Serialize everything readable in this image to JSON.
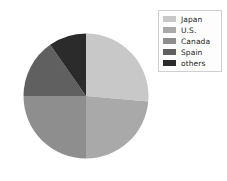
{
  "chart_data": {
    "type": "pie",
    "title": "",
    "categories": [
      "Japan",
      "U.S.",
      "Canada",
      "Spain",
      "others"
    ],
    "values": [
      26,
      24,
      25,
      15,
      10
    ],
    "units": "percent",
    "start_angle_deg": 90,
    "direction": "clockwise",
    "slice_boundaries_deg_clockwise_from_top": [
      0,
      95,
      180,
      270,
      325,
      360
    ],
    "colors": [
      "#c8c8c8",
      "#a9a9a9",
      "#8e8e8e",
      "#606060",
      "#2b2b2b"
    ],
    "legend": {
      "position": "upper right",
      "border_color": "#cfcfcf",
      "background": "#fdfdfd",
      "entries": [
        {
          "label": "Japan",
          "color": "#c8c8c8"
        },
        {
          "label": "U.S.",
          "color": "#a9a9a9"
        },
        {
          "label": "Canada",
          "color": "#8e8e8e"
        },
        {
          "label": "Spain",
          "color": "#606060"
        },
        {
          "label": "others",
          "color": "#2b2b2b"
        }
      ]
    },
    "grid": false,
    "xlabel": "",
    "ylabel": ""
  },
  "figure": {
    "background": "#ffffff"
  }
}
